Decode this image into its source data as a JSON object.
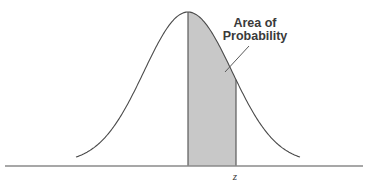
{
  "diagram": {
    "annotation": {
      "line1": "Area of",
      "line2": "Probability"
    },
    "axis_label": "z",
    "colors": {
      "curve": "#4a4a4a",
      "shade": "#c8c8c8",
      "axis": "#8a8a8a",
      "text": "#3a3a3a"
    }
  },
  "chart_data": {
    "type": "area",
    "title": "",
    "distribution": "standard normal",
    "shaded_region": {
      "from": "mean (0)",
      "to": "z"
    },
    "annotations": [
      "Area of Probability"
    ],
    "x_tick_labels": [
      "z"
    ],
    "xlabel": "",
    "ylabel": ""
  }
}
